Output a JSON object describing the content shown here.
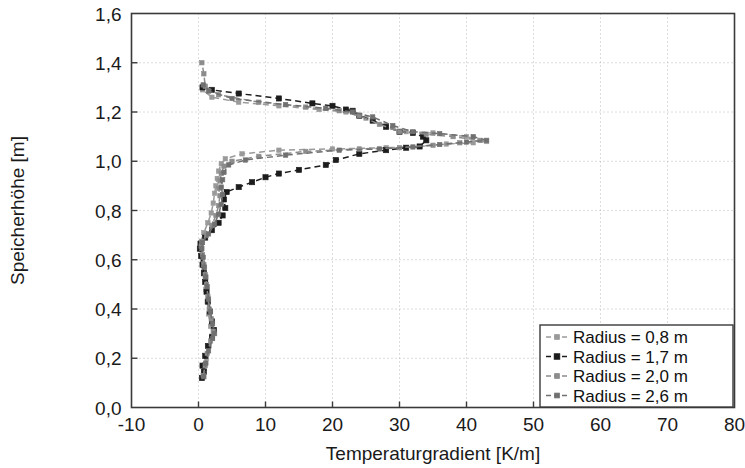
{
  "chart_data": {
    "type": "line",
    "title": "",
    "xlabel": "Temperaturgradient [K/m]",
    "ylabel": "Speicherhöhe [m]",
    "xlim": [
      -10,
      80
    ],
    "ylim": [
      0.0,
      1.6
    ],
    "xticks": [
      -10,
      0,
      10,
      20,
      30,
      40,
      50,
      60,
      70,
      80
    ],
    "xtick_labels": [
      "-10",
      "0",
      "10",
      "20",
      "30",
      "40",
      "50",
      "60",
      "70",
      "80"
    ],
    "yticks": [
      0.0,
      0.2,
      0.4,
      0.6,
      0.8,
      1.0,
      1.2,
      1.4,
      1.6
    ],
    "ytick_labels": [
      "0,0",
      "0,2",
      "0,4",
      "0,6",
      "0,8",
      "1,0",
      "1,2",
      "1,4",
      "1,6"
    ],
    "grid": true,
    "grid_style": "dotted",
    "legend_position": "lower right",
    "orientation": "x = value, y = height",
    "series": [
      {
        "name": "Radius = 0,8 m",
        "color": "#9a9a9a",
        "linestyle": "dashed",
        "marker": "square",
        "points": [
          [
            0.6,
            0.12
          ],
          [
            0.9,
            0.16
          ],
          [
            1.2,
            0.2
          ],
          [
            1.6,
            0.25
          ],
          [
            2.0,
            0.29
          ],
          [
            1.8,
            0.33
          ],
          [
            1.5,
            0.38
          ],
          [
            1.3,
            0.43
          ],
          [
            1.1,
            0.48
          ],
          [
            1.0,
            0.52
          ],
          [
            0.8,
            0.56
          ],
          [
            0.6,
            0.6
          ],
          [
            0.4,
            0.64
          ],
          [
            0.3,
            0.67
          ],
          [
            0.8,
            0.71
          ],
          [
            1.4,
            0.75
          ],
          [
            1.9,
            0.79
          ],
          [
            2.2,
            0.83
          ],
          [
            2.4,
            0.87
          ],
          [
            2.6,
            0.9
          ],
          [
            2.8,
            0.93
          ],
          [
            3.0,
            0.96
          ],
          [
            3.4,
            0.99
          ],
          [
            4.0,
            1.01
          ],
          [
            6.5,
            1.03
          ],
          [
            12.0,
            1.045
          ],
          [
            20.0,
            1.05
          ],
          [
            28.0,
            1.055
          ],
          [
            33.0,
            1.06
          ],
          [
            37.0,
            1.07
          ],
          [
            41.0,
            1.075
          ],
          [
            43.0,
            1.08
          ],
          [
            40.0,
            1.1
          ],
          [
            35.0,
            1.115
          ],
          [
            31.0,
            1.12
          ],
          [
            28.0,
            1.145
          ],
          [
            25.0,
            1.175
          ],
          [
            22.0,
            1.2
          ],
          [
            18.0,
            1.21
          ],
          [
            12.0,
            1.225
          ],
          [
            6.0,
            1.24
          ],
          [
            2.0,
            1.26
          ],
          [
            0.6,
            1.29
          ]
        ]
      },
      {
        "name": "Radius = 1,7 m",
        "color": "#1c1c1c",
        "linestyle": "dashed",
        "marker": "square",
        "points": [
          [
            0.5,
            0.12
          ],
          [
            0.8,
            0.145
          ],
          [
            0.6,
            0.17
          ],
          [
            1.0,
            0.21
          ],
          [
            1.4,
            0.25
          ],
          [
            2.0,
            0.285
          ],
          [
            2.3,
            0.315
          ],
          [
            2.0,
            0.35
          ],
          [
            1.7,
            0.39
          ],
          [
            1.4,
            0.43
          ],
          [
            1.2,
            0.47
          ],
          [
            1.0,
            0.51
          ],
          [
            0.8,
            0.545
          ],
          [
            0.6,
            0.58
          ],
          [
            0.4,
            0.615
          ],
          [
            0.2,
            0.645
          ],
          [
            0.3,
            0.665
          ],
          [
            1.0,
            0.69
          ],
          [
            2.0,
            0.72
          ],
          [
            3.0,
            0.75
          ],
          [
            3.6,
            0.78
          ],
          [
            4.0,
            0.81
          ],
          [
            3.8,
            0.845
          ],
          [
            4.2,
            0.875
          ],
          [
            6.0,
            0.895
          ],
          [
            8.0,
            0.915
          ],
          [
            10.0,
            0.935
          ],
          [
            12.0,
            0.95
          ],
          [
            15.0,
            0.965
          ],
          [
            19.0,
            0.985
          ],
          [
            20.5,
            1.005
          ],
          [
            24.0,
            1.03
          ],
          [
            28.0,
            1.045
          ],
          [
            31.0,
            1.055
          ],
          [
            33.0,
            1.06
          ],
          [
            34.0,
            1.085
          ],
          [
            33.5,
            1.1
          ],
          [
            32.0,
            1.115
          ],
          [
            30.0,
            1.12
          ],
          [
            28.0,
            1.14
          ],
          [
            26.0,
            1.165
          ],
          [
            24.0,
            1.185
          ],
          [
            23.0,
            1.205
          ],
          [
            22.0,
            1.21
          ],
          [
            20.0,
            1.225
          ],
          [
            17.0,
            1.235
          ],
          [
            12.0,
            1.255
          ],
          [
            6.0,
            1.275
          ],
          [
            2.0,
            1.29
          ],
          [
            0.6,
            1.3
          ]
        ]
      },
      {
        "name": "Radius = 2,0 m",
        "color": "#8c8c8c",
        "linestyle": "dashed",
        "marker": "square",
        "points": [
          [
            0.7,
            0.13
          ],
          [
            1.0,
            0.17
          ],
          [
            1.3,
            0.22
          ],
          [
            1.8,
            0.27
          ],
          [
            2.2,
            0.31
          ],
          [
            1.9,
            0.36
          ],
          [
            1.6,
            0.4
          ],
          [
            1.4,
            0.45
          ],
          [
            1.2,
            0.5
          ],
          [
            1.0,
            0.54
          ],
          [
            0.8,
            0.58
          ],
          [
            0.6,
            0.62
          ],
          [
            0.4,
            0.655
          ],
          [
            0.5,
            0.675
          ],
          [
            1.2,
            0.7
          ],
          [
            2.0,
            0.74
          ],
          [
            2.6,
            0.78
          ],
          [
            3.0,
            0.82
          ],
          [
            3.2,
            0.86
          ],
          [
            3.0,
            0.89
          ],
          [
            3.2,
            0.92
          ],
          [
            3.4,
            0.95
          ],
          [
            3.8,
            0.98
          ],
          [
            5.0,
            1.0
          ],
          [
            9.0,
            1.02
          ],
          [
            16.0,
            1.04
          ],
          [
            24.0,
            1.05
          ],
          [
            30.0,
            1.055
          ],
          [
            35.0,
            1.065
          ],
          [
            39.0,
            1.075
          ],
          [
            42.0,
            1.085
          ],
          [
            38.0,
            1.1
          ],
          [
            34.0,
            1.11
          ],
          [
            30.0,
            1.12
          ],
          [
            27.0,
            1.15
          ],
          [
            24.0,
            1.185
          ],
          [
            21.0,
            1.205
          ],
          [
            16.0,
            1.22
          ],
          [
            9.0,
            1.24
          ],
          [
            3.0,
            1.27
          ],
          [
            1.0,
            1.305
          ],
          [
            0.8,
            1.355
          ],
          [
            0.5,
            1.4
          ]
        ]
      },
      {
        "name": "Radius = 2,6 m",
        "color": "#707070",
        "linestyle": "dashed",
        "marker": "square",
        "points": [
          [
            0.8,
            0.125
          ],
          [
            1.1,
            0.18
          ],
          [
            1.5,
            0.23
          ],
          [
            2.1,
            0.28
          ],
          [
            2.4,
            0.3
          ],
          [
            2.1,
            0.34
          ],
          [
            1.8,
            0.39
          ],
          [
            1.5,
            0.44
          ],
          [
            1.3,
            0.49
          ],
          [
            1.1,
            0.53
          ],
          [
            0.9,
            0.57
          ],
          [
            0.7,
            0.61
          ],
          [
            0.5,
            0.645
          ],
          [
            0.6,
            0.67
          ],
          [
            1.5,
            0.705
          ],
          [
            2.4,
            0.745
          ],
          [
            3.0,
            0.785
          ],
          [
            3.4,
            0.825
          ],
          [
            3.6,
            0.865
          ],
          [
            3.4,
            0.895
          ],
          [
            3.6,
            0.925
          ],
          [
            3.8,
            0.955
          ],
          [
            4.5,
            0.985
          ],
          [
            7.0,
            1.005
          ],
          [
            13.0,
            1.025
          ],
          [
            21.0,
            1.045
          ],
          [
            27.0,
            1.05
          ],
          [
            32.0,
            1.058
          ],
          [
            36.0,
            1.068
          ],
          [
            40.0,
            1.078
          ],
          [
            43.0,
            1.085
          ],
          [
            41.0,
            1.1
          ],
          [
            36.0,
            1.112
          ],
          [
            32.0,
            1.12
          ],
          [
            29.0,
            1.145
          ],
          [
            26.0,
            1.18
          ],
          [
            23.0,
            1.2
          ],
          [
            19.0,
            1.215
          ],
          [
            13.0,
            1.23
          ],
          [
            5.0,
            1.255
          ],
          [
            1.5,
            1.285
          ],
          [
            0.7,
            1.31
          ]
        ]
      }
    ]
  },
  "legend": {
    "items": [
      {
        "label": "Radius = 0,8 m"
      },
      {
        "label": "Radius = 1,7 m"
      },
      {
        "label": "Radius = 2,0 m"
      },
      {
        "label": "Radius = 2,6 m"
      }
    ]
  }
}
